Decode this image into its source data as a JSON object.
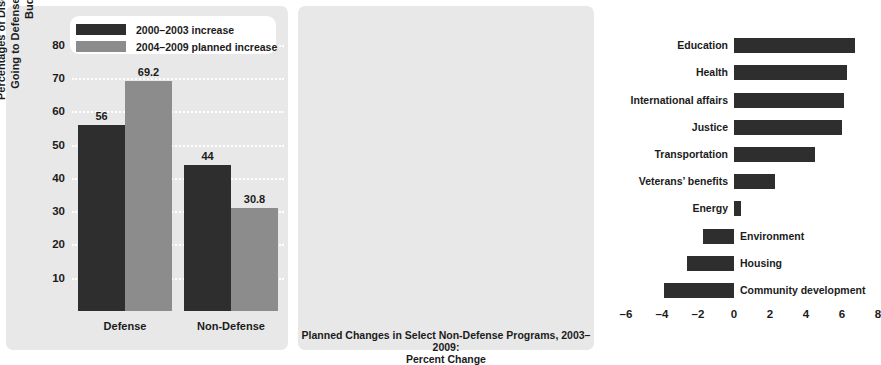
{
  "chart_data": [
    {
      "type": "bar",
      "id": "defense-vs-nondefense",
      "title": "",
      "xlabel": "",
      "ylabel": "Percentages of Discretionary Increases Going to Defense and non-Defense Budgets",
      "categories": [
        "Defense",
        "Non-Defense"
      ],
      "ylim": [
        0,
        85
      ],
      "yticks": [
        10,
        20,
        30,
        40,
        50,
        60,
        70,
        80
      ],
      "grid": "horizontal-dotted-white",
      "legend_position": "top-center",
      "series": [
        {
          "name": "2000–2003 increase",
          "color": "#2e2e2e",
          "values": [
            56,
            44
          ],
          "labels": [
            "56",
            "44"
          ]
        },
        {
          "name": "2004–2009 planned increase",
          "color": "#8c8c8c",
          "values": [
            69.2,
            30.8
          ],
          "labels": [
            "69.2",
            "30.8"
          ]
        }
      ]
    },
    {
      "type": "bar",
      "id": "planned-changes-nondefense",
      "orientation": "horizontal",
      "title": "",
      "xlabel": "Planned Changes in Select Non-Defense Programs, 2003–2009: Percent Change",
      "ylabel": "",
      "xlim": [
        -6,
        8
      ],
      "xticks": [
        -6,
        -4,
        -2,
        0,
        2,
        4,
        6,
        8
      ],
      "xticklabels": [
        "–6",
        "–4",
        "–2",
        "0",
        "2",
        "4",
        "6",
        "8"
      ],
      "grid": "vertical-dotted-white",
      "bar_color": "#2e2e2e",
      "categories": [
        "Education",
        "Health",
        "International affairs",
        "Justice",
        "Transportation",
        "Veterans’ benefits",
        "Energy",
        "Environment",
        "Housing",
        "Community development"
      ],
      "values": [
        6.7,
        6.3,
        6.1,
        6.0,
        4.5,
        2.3,
        0.4,
        -1.7,
        -2.6,
        -3.9
      ]
    }
  ],
  "left": {
    "ylabel": "Percentages of Discretionary Increases Going to Defense and non-Defense Budgets",
    "yticks": [
      "80",
      "70",
      "60",
      "50",
      "40",
      "30",
      "20",
      "10"
    ],
    "categories": [
      "Defense",
      "Non-Defense"
    ],
    "values": [
      "56",
      "69.2",
      "44",
      "30.8"
    ],
    "legend": [
      {
        "label": "2000–2003 increase"
      },
      {
        "label": "2004–2009 planned increase"
      }
    ]
  },
  "right": {
    "categories": [
      "Education",
      "Health",
      "International affairs",
      "Justice",
      "Transportation",
      "Veterans’ benefits",
      "Energy",
      "Environment",
      "Housing",
      "Community development"
    ],
    "xticks": [
      "–6",
      "–4",
      "–2",
      "0",
      "2",
      "4",
      "6",
      "8"
    ],
    "caption_line1": "Planned Changes in Select Non-Defense Programs, 2003–2009:",
    "caption_line2": "Percent Change"
  },
  "colors": {
    "panel_bg": "#e8e8e8",
    "series_dark": "#2e2e2e",
    "series_gray": "#8c8c8c",
    "grid": "#ffffff"
  }
}
